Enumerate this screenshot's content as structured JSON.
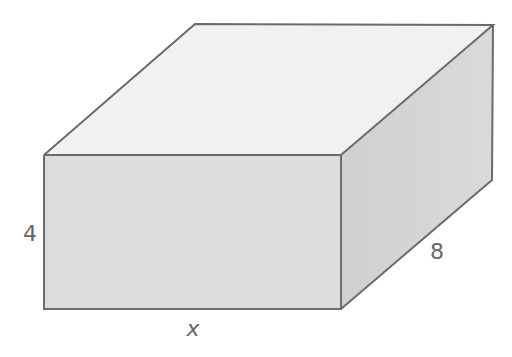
{
  "diagram": {
    "type": "rectangular-prism",
    "labels": {
      "height": "4",
      "depth": "8",
      "width": "x"
    },
    "colors": {
      "top_face": "#f1f1f1",
      "front_face": "#dcdcdc",
      "side_face": "#d0d0d0",
      "side_face_light": "#dadada",
      "edge": "#6b6b6b",
      "label": "#666666"
    },
    "vertices": {
      "front_top_left": [
        44,
        155
      ],
      "front_top_right": [
        341,
        155
      ],
      "front_bottom_left": [
        44,
        309
      ],
      "front_bottom_right": [
        341,
        309
      ],
      "back_top_left": [
        195,
        24
      ],
      "back_top_right": [
        493,
        25
      ],
      "back_bottom_right": [
        492,
        180
      ]
    }
  }
}
